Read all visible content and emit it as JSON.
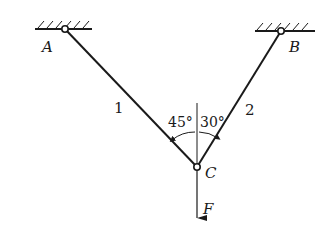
{
  "diagram": {
    "type": "two-bar truss with hanging load",
    "supports": [
      {
        "id": "A",
        "label": "A",
        "type": "fixed pin (ceiling)"
      },
      {
        "id": "B",
        "label": "B",
        "type": "fixed pin (ceiling)"
      }
    ],
    "members": [
      {
        "id": "1",
        "label": "1",
        "from": "A",
        "to": "C",
        "angle_from_vertical": "45°"
      },
      {
        "id": "2",
        "label": "2",
        "from": "B",
        "to": "C",
        "angle_from_vertical": "30°"
      }
    ],
    "joint": {
      "id": "C",
      "label": "C"
    },
    "load": {
      "label": "F",
      "direction": "down"
    },
    "angles": {
      "left": "45°",
      "right": "30°"
    }
  }
}
